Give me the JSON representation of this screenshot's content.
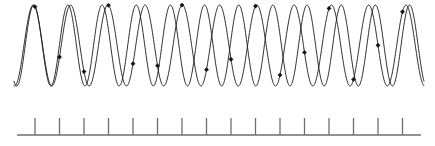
{
  "figure": {
    "title": "Two sinusoids of nearly equal frequency with sampling instants",
    "description": "Two overlapping sine waves drawn across the panel, with filled diamond sample markers where the waves are sampled, and a horizontal sampling axis with evenly spaced vertical tick marks below.",
    "background_color": "#ffffff",
    "width": 435,
    "height": 146
  },
  "colors": {
    "wave_stroke": "#1a1a1a",
    "marker_fill": "#111111",
    "axis_stroke": "#6e6e6e"
  },
  "chart_data": {
    "type": "line",
    "title": "Two sinusoids of nearly equal frequency with sampling instants",
    "xlabel": "",
    "ylabel": "",
    "grid": false,
    "legend": "none",
    "xlim": [
      0,
      435
    ],
    "ylim": [
      -1,
      1
    ],
    "plot_box": {
      "left": 14,
      "right": 424,
      "top": 5,
      "bottom": 86,
      "baseline_y": 45.5,
      "amplitude_px": 40.5
    },
    "series": [
      {
        "name": "wave-a",
        "role": "original-signal",
        "waveform": "sine",
        "cycles_across_panel": 11.0,
        "amplitude": 1.0,
        "phase_deg": -96,
        "stroke": "#1a1a1a"
      },
      {
        "name": "wave-b",
        "role": "alias-signal",
        "waveform": "sine",
        "cycles_across_panel": 12.0,
        "amplitude": 1.0,
        "phase_deg": -118,
        "stroke": "#1a1a1a"
      }
    ],
    "markers": {
      "name": "sample-points",
      "shape": "diamond",
      "count": 16,
      "size_px": 4.2,
      "x": [
        35,
        59.5,
        84,
        108.5,
        133,
        157.5,
        182,
        206.5,
        231,
        255.5,
        280,
        304.5,
        329,
        353.5,
        378,
        402.5
      ]
    }
  },
  "axis": {
    "name": "sampling-axis",
    "baseline": {
      "x_start": 17,
      "x_end": 421,
      "y": 135
    },
    "ticks": {
      "count": 16,
      "first_x": 35,
      "spacing": 24.5,
      "height": 17,
      "top_y": 118,
      "bottom_y": 135,
      "positions": [
        35,
        59.5,
        84,
        108.5,
        133,
        157.5,
        182,
        206.5,
        231,
        255.5,
        280,
        304.5,
        329,
        353.5,
        378,
        402.5
      ]
    }
  }
}
